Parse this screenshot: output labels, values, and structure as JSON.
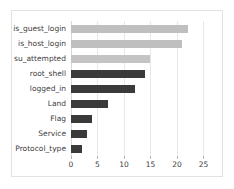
{
  "chart_data": {
    "type": "bar",
    "orientation": "horizontal",
    "title": "",
    "xlabel": "",
    "ylabel": "",
    "xlim": [
      0,
      27
    ],
    "grid": true,
    "legend": false,
    "xticks": [
      0,
      5,
      10,
      15,
      20,
      25
    ],
    "categories": [
      "is_guest_login",
      "is_host_login",
      "su_attempted",
      "root_shell",
      "logged_in",
      "Land",
      "Flag",
      "Service",
      "Protocol_type"
    ],
    "values": [
      22,
      21,
      15,
      14,
      12,
      7,
      4,
      3,
      2
    ],
    "bar_colors": [
      "#bfbfbf",
      "#bfbfbf",
      "#c4c4c4",
      "#3a3a3a",
      "#3a3a3a",
      "#3a3a3a",
      "#3a3a3a",
      "#3a3a3a",
      "#3a3a3a"
    ]
  },
  "style": {
    "frame_border": "#e2e2e2",
    "gridline": "#e8e8e8",
    "axis_line": "#d8d8d8",
    "text": "#404040",
    "background": "#ffffff"
  }
}
